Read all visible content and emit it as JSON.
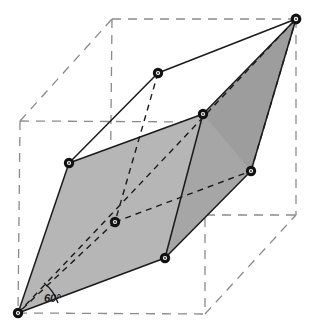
{
  "figure": {
    "type": "crystal-lattice-diagram",
    "angle_annotation": {
      "label": "60°",
      "value": 60,
      "unit": "degrees",
      "position": {
        "x": 44,
        "y": 292
      }
    },
    "colors": {
      "background": "#ffffff",
      "face_light": "#b6b6b6",
      "face_mid": "#ababab",
      "face_dark": "#9d9d9d",
      "solid_edge": "#1a1a1a",
      "dashed_cube_edge": "#8a8a8a",
      "dashed_inner_edge": "#1a1a1a",
      "vertex_fill": "#111111",
      "vertex_ring": "#ffffff"
    },
    "cube": {
      "name": "reference-cube",
      "edge_style": "dashed",
      "corners": [
        {
          "id": "cube-front-bottom-left",
          "x": 18,
          "y": 313
        },
        {
          "id": "cube-front-bottom-right",
          "x": 205,
          "y": 314
        },
        {
          "id": "cube-front-top-right",
          "x": 205,
          "y": 122
        },
        {
          "id": "cube-front-top-left",
          "x": 20,
          "y": 121
        },
        {
          "id": "cube-back-bottom-left",
          "x": 110,
          "y": 215
        },
        {
          "id": "cube-back-bottom-right",
          "x": 296,
          "y": 215
        },
        {
          "id": "cube-back-top-right",
          "x": 296,
          "y": 19
        },
        {
          "id": "cube-back-top-left",
          "x": 112,
          "y": 19
        }
      ]
    },
    "rhombohedron": {
      "name": "rhombohedral-cell",
      "vertices": [
        {
          "id": "v-bottom",
          "x": 18,
          "y": 313
        },
        {
          "id": "v-lower-mid",
          "x": 165,
          "y": 258
        },
        {
          "id": "v-right-lower",
          "x": 251,
          "y": 171
        },
        {
          "id": "v-center-inner",
          "x": 115,
          "y": 222
        },
        {
          "id": "v-left-upper",
          "x": 69,
          "y": 163
        },
        {
          "id": "v-mid-upper",
          "x": 203,
          "y": 114
        },
        {
          "id": "v-top-back",
          "x": 158,
          "y": 73
        },
        {
          "id": "v-top",
          "x": 296,
          "y": 19
        }
      ],
      "faces": [
        {
          "id": "face-front-left",
          "shade": "light",
          "vertices": [
            "v-bottom",
            "v-lower-mid",
            "v-mid-upper",
            "v-left-upper"
          ]
        },
        {
          "id": "face-front-right",
          "shade": "mid",
          "vertices": [
            "v-lower-mid",
            "v-right-lower",
            "v-top",
            "v-mid-upper"
          ]
        },
        {
          "id": "face-upper-right",
          "shade": "dark",
          "vertices": [
            "v-mid-upper",
            "v-top",
            "v-top",
            "v-mid-upper"
          ]
        }
      ]
    }
  }
}
